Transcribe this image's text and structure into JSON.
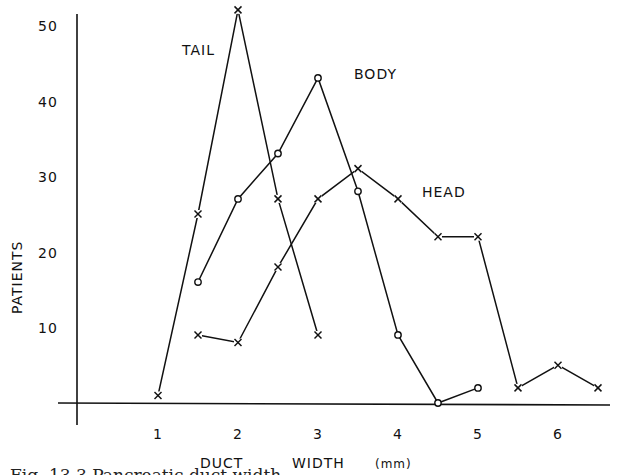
{
  "chart_data": {
    "type": "line",
    "title": "",
    "xlabel": "DUCT WIDTH (mm)",
    "xlabel_parts": [
      "DUCT",
      "WIDTH",
      "(mm)"
    ],
    "ylabel": "PATIENTS",
    "xlim": [
      0,
      6.6
    ],
    "ylim": [
      0,
      52
    ],
    "x_ticks": [
      1,
      2,
      3,
      4,
      5,
      6
    ],
    "x_tick_labels": [
      "1",
      "2",
      "3",
      "4",
      "5",
      "6"
    ],
    "y_ticks": [
      10,
      20,
      30,
      40,
      50
    ],
    "y_tick_labels": [
      "10",
      "20",
      "30",
      "40",
      "50"
    ],
    "grid": false,
    "legend": "inline labels",
    "series": [
      {
        "name": "TAIL",
        "marker": "x",
        "x": [
          1,
          1.5,
          2,
          2.5,
          3
        ],
        "values": [
          1,
          25,
          52,
          27,
          9
        ],
        "label_pos": [
          1.3,
          46
        ]
      },
      {
        "name": "BODY",
        "marker": "o",
        "x": [
          1.5,
          2,
          2.5,
          3,
          3.5,
          4,
          4.5,
          5
        ],
        "values": [
          16,
          27,
          33,
          43,
          28,
          9,
          0,
          2
        ],
        "label_pos": [
          3.45,
          42.8
        ]
      },
      {
        "name": "HEAD",
        "marker": "x",
        "x": [
          1.5,
          2,
          2.5,
          3,
          3.5,
          4,
          4.5,
          5,
          5.5,
          6,
          6.5
        ],
        "values": [
          9,
          8,
          18,
          27,
          31,
          27,
          22,
          22,
          2,
          5,
          2
        ],
        "label_pos": [
          4.3,
          27.3
        ]
      }
    ]
  },
  "caption": "Fig. 13.3 Pancreatic duct width"
}
